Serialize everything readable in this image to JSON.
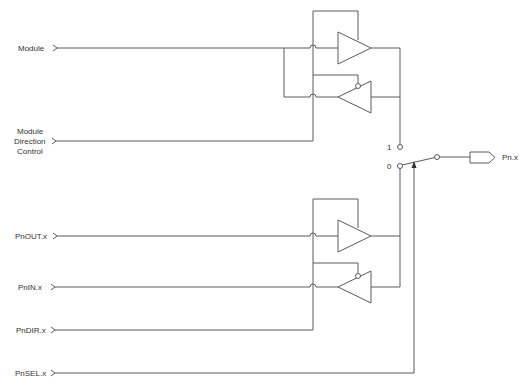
{
  "diagram": {
    "type": "I/O pin multiplexer schematic",
    "inputs": {
      "module": "Module",
      "module_dir_1": "Module",
      "module_dir_2": "Direction",
      "module_dir_3": "Control",
      "pnout": "PnOUT.x",
      "pnin": "PnIN.x",
      "pndir": "PnDIR.x",
      "pnsel": "PnSEL.x"
    },
    "mux": {
      "input_1_label": "1",
      "input_0_label": "0"
    },
    "output": {
      "pin_label": "Pn.x"
    },
    "colors": {
      "line": "#5a5a5a",
      "text": "#333333",
      "background": "#ffffff"
    }
  }
}
